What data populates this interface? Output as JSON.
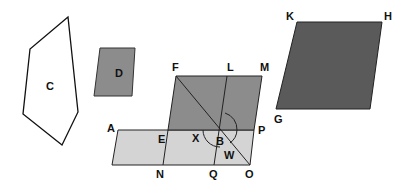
{
  "colors": {
    "stroke": "#111111",
    "dark_fill": "#5a5a5a",
    "mid_fill": "#8c8c8c",
    "light_fill": "#d4d4d4",
    "white_fill": "#ffffff"
  },
  "shapes": {
    "C": {
      "label": "C"
    },
    "D": {
      "label": "D"
    },
    "KHG": {
      "labels": {
        "K": "K",
        "H": "H",
        "G": "G"
      }
    },
    "composite": {
      "labels": {
        "F": "F",
        "L": "L",
        "M": "M",
        "A": "A",
        "E": "E",
        "X": "X",
        "B": "B",
        "P": "P",
        "W": "W",
        "N": "N",
        "Q": "Q",
        "O": "O"
      }
    }
  }
}
